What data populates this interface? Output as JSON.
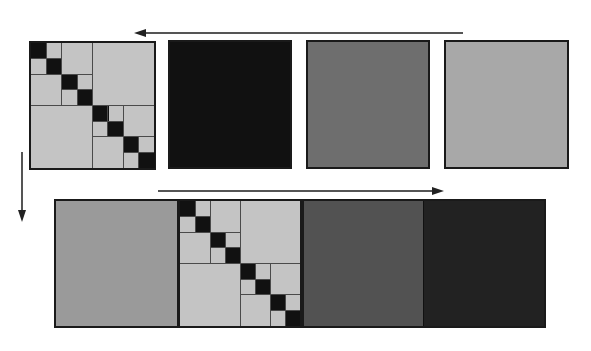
{
  "diagram": {
    "type": "block-matrix-permutation",
    "colors": {
      "light_gray": "#c4c4c4",
      "black": "#111111",
      "mid_gray": "#6e6e6e",
      "gray": "#a8a8a8",
      "dark_gray": "#525252",
      "near_black": "#222222",
      "border": "#1a1a1a",
      "arrow": "#555555"
    },
    "top_row": {
      "panels": [
        {
          "id": "block-matrix",
          "kind": "hierarchical-block-diagonal"
        },
        {
          "id": "black-square",
          "kind": "solid",
          "color": "#111111"
        },
        {
          "id": "mid-gray-square",
          "kind": "solid",
          "color": "#6e6e6e"
        },
        {
          "id": "light-gray-square",
          "kind": "solid",
          "color": "#a8a8a8"
        }
      ],
      "arrow": {
        "direction": "left"
      }
    },
    "side_arrow": {
      "direction": "down"
    },
    "bottom_row": {
      "segments": [
        {
          "id": "gray-segment",
          "kind": "solid",
          "color": "#9a9a9a"
        },
        {
          "id": "block-matrix",
          "kind": "hierarchical-block-diagonal"
        },
        {
          "id": "dark-gray-segment",
          "kind": "solid",
          "color": "#525252"
        },
        {
          "id": "near-black-segment",
          "kind": "solid",
          "color": "#222222"
        }
      ],
      "arrow": {
        "direction": "right"
      }
    },
    "block_matrix": {
      "size": 8,
      "diagonal_cells": 8,
      "levels": [
        "8x8",
        "4x4",
        "2x2",
        "1x1"
      ]
    }
  }
}
